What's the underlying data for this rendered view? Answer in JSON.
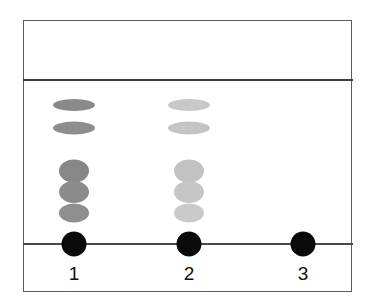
{
  "figure": {
    "name": "thin-layer-chromatography-plate",
    "background_color": "#ffffff",
    "border_color": "#5d5d5d",
    "plate": {
      "x": 23,
      "y": 20,
      "width": 329,
      "height": 272
    }
  },
  "lines": {
    "solvent_front": {
      "label": "solvent front",
      "y": 79,
      "color": "#3d3d3d",
      "thickness": 2
    },
    "baseline": {
      "label": "origin baseline",
      "y": 243,
      "color": "#4a4a4a",
      "thickness": 1.6
    }
  },
  "lanes": [
    {
      "label": "1",
      "center_x": 74,
      "label_y": 264,
      "origin": {
        "cx": 74,
        "cy": 244,
        "r": 12.5,
        "color": "#0a0a0a"
      },
      "spots": [
        {
          "name": "band-1a",
          "cx": 74,
          "cy": 105,
          "rx": 21,
          "ry": 6,
          "color": "#8a8a8a"
        },
        {
          "name": "band-1b",
          "cx": 74,
          "cy": 128,
          "rx": 21,
          "ry": 6.5,
          "color": "#8d8d8d"
        },
        {
          "name": "band-1c",
          "cx": 74,
          "cy": 171,
          "rx": 15,
          "ry": 11.5,
          "color": "#878787"
        },
        {
          "name": "band-1d",
          "cx": 74,
          "cy": 192,
          "rx": 15,
          "ry": 11,
          "color": "#8b8b8b"
        },
        {
          "name": "band-1e",
          "cx": 74,
          "cy": 213,
          "rx": 15,
          "ry": 9.5,
          "color": "#8f8f8f"
        }
      ]
    },
    {
      "label": "2",
      "center_x": 189,
      "label_y": 264,
      "origin": {
        "cx": 189,
        "cy": 244,
        "r": 12.5,
        "color": "#0a0a0a"
      },
      "spots": [
        {
          "name": "band-2a",
          "cx": 189,
          "cy": 105,
          "rx": 21,
          "ry": 6,
          "color": "#c8c8c8"
        },
        {
          "name": "band-2b",
          "cx": 189,
          "cy": 128,
          "rx": 21,
          "ry": 6.5,
          "color": "#c4c4c4"
        },
        {
          "name": "band-2c",
          "cx": 189,
          "cy": 171,
          "rx": 15,
          "ry": 11.5,
          "color": "#c2c2c2"
        },
        {
          "name": "band-2d",
          "cx": 189,
          "cy": 192,
          "rx": 15,
          "ry": 11,
          "color": "#c6c6c6"
        },
        {
          "name": "band-2e",
          "cx": 189,
          "cy": 213,
          "rx": 15,
          "ry": 9.5,
          "color": "#c9c9c9"
        }
      ]
    },
    {
      "label": "3",
      "center_x": 303,
      "label_y": 264,
      "origin": {
        "cx": 303,
        "cy": 244,
        "r": 12.5,
        "color": "#0a0a0a"
      },
      "spots": []
    }
  ]
}
